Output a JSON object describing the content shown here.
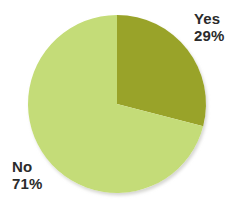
{
  "chart_data": {
    "type": "pie",
    "title": "",
    "categories": [
      "Yes",
      "No"
    ],
    "values": [
      29,
      71
    ],
    "unit": "%",
    "legend": "none",
    "labels_position": "outside",
    "start_angle_deg": 0,
    "direction": "clockwise",
    "slices": [
      {
        "name": "Yes",
        "value": 29,
        "value_label": "29%",
        "color": "#99a329",
        "start_deg": 0,
        "sweep_deg": 104.4
      },
      {
        "name": "No",
        "value": 71,
        "value_label": "71%",
        "color": "#c4dc78",
        "start_deg": 104.4,
        "sweep_deg": 255.6
      }
    ]
  },
  "geometry": {
    "center_x": 117,
    "center_y": 104,
    "radius": 89
  },
  "style": {
    "background": "#ffffff",
    "text_color": "#2b2b2b",
    "shadow_color": "#e3e3e0"
  }
}
